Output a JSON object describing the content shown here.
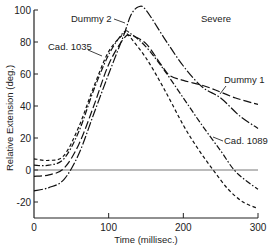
{
  "chart_data": {
    "type": "line",
    "title": "",
    "annotation_condition": "Severe",
    "xlabel": "Time (millisec.)",
    "ylabel": "Relative Extension (deg.)",
    "xlim": [
      0,
      300
    ],
    "ylim": [
      -30,
      100
    ],
    "x_ticks": [
      0,
      100,
      200,
      300
    ],
    "y_ticks": [
      100,
      80,
      60,
      40,
      20,
      0,
      -20
    ],
    "grid": false,
    "reference_line_y": 0,
    "legend": "inline labels with leader arrows",
    "series": [
      {
        "name": "Dummy 2",
        "style": "solid (mixed with dash-dot-dot segments)",
        "x": [
          0,
          20,
          40,
          60,
          80,
          100,
          120,
          130,
          140,
          150,
          175,
          200,
          225,
          250,
          275,
          300
        ],
        "y": [
          -13,
          -11,
          -6,
          10,
          35,
          60,
          84,
          97,
          102,
          100,
          82,
          65,
          52,
          45,
          34,
          26
        ]
      },
      {
        "name": "Cad. 1035",
        "style": "dash-dot",
        "x": [
          0,
          20,
          40,
          60,
          80,
          100,
          120,
          130,
          150,
          175,
          200,
          225,
          250,
          268,
          285,
          300
        ],
        "y": [
          3,
          3,
          7,
          24,
          50,
          72,
          86,
          85,
          77,
          62,
          45,
          28,
          12,
          0,
          -7,
          -12
        ]
      },
      {
        "name": "Dummy 1",
        "style": "long dash",
        "x": [
          0,
          20,
          40,
          60,
          80,
          100,
          120,
          130,
          150,
          170,
          182,
          200,
          225,
          243,
          270,
          300
        ],
        "y": [
          -4,
          -3,
          1,
          16,
          40,
          66,
          82,
          84,
          79,
          66,
          59,
          56,
          53,
          50,
          45,
          41
        ]
      },
      {
        "name": "Cad. 1089",
        "style": "short dash",
        "x": [
          0,
          20,
          40,
          60,
          80,
          100,
          120,
          125,
          150,
          175,
          200,
          220,
          240,
          260,
          280,
          300
        ],
        "y": [
          7,
          6,
          9,
          27,
          52,
          74,
          85,
          85,
          70,
          50,
          28,
          13,
          0,
          -12,
          -20,
          -24
        ]
      }
    ],
    "labels": [
      {
        "text": "Dummy 2",
        "x_pixel": 98,
        "y_pixel": 18
      },
      {
        "text": "Cad. 1035",
        "x_pixel": 48,
        "y_pixel": 47
      },
      {
        "text": "Dummy 1",
        "x_pixel": 224,
        "y_pixel": 80
      },
      {
        "text": "Cad. 1089",
        "x_pixel": 224,
        "y_pixel": 141
      },
      {
        "text": "Severe",
        "x_pixel": 201,
        "y_pixel": 22
      }
    ]
  }
}
